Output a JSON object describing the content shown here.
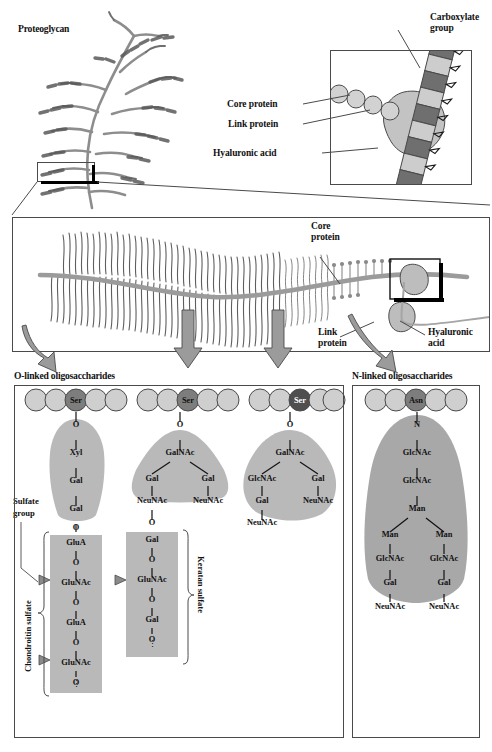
{
  "figure": {
    "title": "Proteoglycan",
    "colors": {
      "gray_fill": "#9a9a9a",
      "light_gray": "#cfcfcf",
      "mid_gray": "#b5b5b5",
      "dark_gray": "#6e6e6e",
      "outline": "#4a4a4a",
      "blob": "#a8a8a8",
      "residue_dark": "#777777"
    }
  },
  "inset_top": {
    "labels": [
      {
        "text": "Carboxylate",
        "sub": "group"
      },
      {
        "text": "Core protein"
      },
      {
        "text": "Link protein"
      },
      {
        "text": "Hyaluronic acid"
      }
    ],
    "carboxylate_line1": "Carboxylate",
    "carboxylate_line2": "group",
    "core_protein": "Core protein",
    "link_protein": "Link protein",
    "hyaluronic_acid": "Hyaluronic acid"
  },
  "middle_panel": {
    "core_protein_line1": "Core",
    "core_protein_line2": "protein",
    "link_protein_line1": "Link",
    "link_protein_line2": "protein",
    "hyaluronic_line1": "Hyaluronic",
    "hyaluronic_line2": "acid"
  },
  "sections": {
    "o_linked": "O-linked oligosaccharides",
    "n_linked": "N-linked oligosaccharides"
  },
  "annotations": {
    "sulfate_line1": "Sulfate",
    "sulfate_line2": "group",
    "chondroitin_sulfate": "Chondroitin sulfate",
    "keratan_sulfate": "Keratan sulfate",
    "ellipsis": "⋮"
  },
  "residues": {
    "ser": "Ser",
    "asn": "Asn",
    "o": "O",
    "n": "N"
  },
  "chains": {
    "o1": {
      "anchor": "Ser",
      "link": "O",
      "core": [
        "Xyl",
        "Gal",
        "Gal"
      ],
      "bridge": "O",
      "repeat": [
        "GluA",
        "O",
        "GluNAc",
        "O",
        "GluA",
        "O",
        "GluNAc",
        "O"
      ],
      "glycan_name": "Chondroitin sulfate",
      "sulfate_targets": [
        "GluNAc",
        "GluNAc"
      ]
    },
    "o2": {
      "anchor": "Ser",
      "link": "O",
      "core_top": "GalNAc",
      "branch_left": [
        "Gal",
        "NeuNAc"
      ],
      "branch_right": [
        "Gal",
        "NeuNAc"
      ],
      "bridge": "O",
      "repeat": [
        "Gal",
        "O",
        "GluNAc",
        "O",
        "Gal",
        "O"
      ],
      "glycan_name": "Keratan sulfate",
      "sulfate_targets": [
        "GluNAc"
      ]
    },
    "o3": {
      "anchor": "Ser",
      "link": "O",
      "core_top": "GalNAc",
      "branch_left": [
        "GlcNAc",
        "Gal",
        "NeuNAc"
      ],
      "branch_right": [
        "Gal",
        "NeuNAc"
      ]
    },
    "n1": {
      "anchor": "Asn",
      "link": "N",
      "stem": [
        "GlcNAc",
        "GlcNAc",
        "Man"
      ],
      "branch_left": [
        "Man",
        "GlcNAc",
        "Gal",
        "NeuNAc"
      ],
      "branch_right": [
        "Man",
        "GlcNAc",
        "Gal",
        "NeuNAc"
      ]
    }
  }
}
